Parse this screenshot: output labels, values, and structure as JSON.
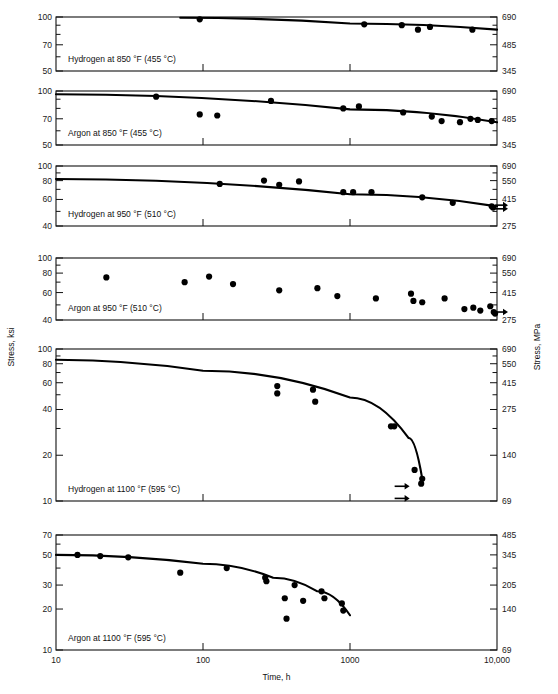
{
  "figure": {
    "y_axis_left_title": "Stress, ksi",
    "y_axis_right_title": "Stress, MPa",
    "x_axis_title": "Time, h",
    "x_ticks": [
      "10",
      "100",
      "1000",
      "10,000"
    ]
  },
  "chart_data": [
    {
      "type": "scatter",
      "title": "Hydrogen at 850 °F (455 °C)",
      "xlabel": "Time, h",
      "ylabel": "Stress, ksi",
      "xscale": "log",
      "yscale": "log",
      "xlim": [
        10,
        10000
      ],
      "ylim": [
        50,
        100
      ],
      "yticks_left": [
        "100",
        "70",
        "50"
      ],
      "yticks_right": [
        "690",
        "485",
        "345"
      ],
      "grid": false,
      "points": [
        {
          "x": 95,
          "y": 97
        },
        {
          "x": 1250,
          "y": 91
        },
        {
          "x": 2250,
          "y": 90
        },
        {
          "x": 2900,
          "y": 85
        },
        {
          "x": 3500,
          "y": 88
        },
        {
          "x": 6800,
          "y": 85
        }
      ],
      "trend": [
        {
          "x": 70,
          "y": 99
        },
        {
          "x": 1000,
          "y": 92
        },
        {
          "x": 10000,
          "y": 85
        }
      ],
      "runouts": []
    },
    {
      "type": "scatter",
      "title": "Argon at 850 °F (455 °C)",
      "xlabel": "Time, h",
      "ylabel": "Stress, ksi",
      "xscale": "log",
      "yscale": "log",
      "xlim": [
        10,
        10000
      ],
      "ylim": [
        50,
        100
      ],
      "yticks_left": [
        "100",
        "70",
        "50"
      ],
      "yticks_right": [
        "690",
        "485",
        "345"
      ],
      "grid": false,
      "points": [
        {
          "x": 48,
          "y": 93
        },
        {
          "x": 95,
          "y": 74
        },
        {
          "x": 125,
          "y": 73
        },
        {
          "x": 290,
          "y": 88
        },
        {
          "x": 900,
          "y": 80
        },
        {
          "x": 1150,
          "y": 82
        },
        {
          "x": 2300,
          "y": 76
        },
        {
          "x": 3600,
          "y": 72
        },
        {
          "x": 4200,
          "y": 68
        },
        {
          "x": 5600,
          "y": 67
        },
        {
          "x": 6600,
          "y": 70
        },
        {
          "x": 7400,
          "y": 69
        },
        {
          "x": 9200,
          "y": 68
        }
      ],
      "trend": [
        {
          "x": 10,
          "y": 96
        },
        {
          "x": 1000,
          "y": 79
        },
        {
          "x": 10000,
          "y": 67
        }
      ],
      "runouts": []
    },
    {
      "type": "scatter",
      "title": "Hydrogen at 950 °F (510 °C)",
      "xlabel": "Time, h",
      "ylabel": "Stress, ksi",
      "xscale": "log",
      "yscale": "log",
      "xlim": [
        10,
        10000
      ],
      "ylim": [
        40,
        100
      ],
      "yticks_left": [
        "100",
        "80",
        "60",
        "40"
      ],
      "yticks_right": [
        "690",
        "550",
        "415",
        "275"
      ],
      "grid": false,
      "points": [
        {
          "x": 130,
          "y": 76
        },
        {
          "x": 260,
          "y": 80
        },
        {
          "x": 330,
          "y": 75
        },
        {
          "x": 450,
          "y": 79
        },
        {
          "x": 900,
          "y": 67
        },
        {
          "x": 1050,
          "y": 67
        },
        {
          "x": 1400,
          "y": 67
        },
        {
          "x": 3100,
          "y": 62
        },
        {
          "x": 5000,
          "y": 57
        },
        {
          "x": 9200,
          "y": 54
        },
        {
          "x": 9400,
          "y": 53
        }
      ],
      "trend": [
        {
          "x": 10,
          "y": 82
        },
        {
          "x": 1000,
          "y": 65
        },
        {
          "x": 10000,
          "y": 54
        }
      ],
      "runouts": [
        {
          "x": 9400,
          "y": 55
        },
        {
          "x": 9400,
          "y": 52
        }
      ]
    },
    {
      "type": "scatter",
      "title": "Argon at 950 °F (510 °C)",
      "xlabel": "Time, h",
      "ylabel": "Stress, ksi",
      "xscale": "log",
      "yscale": "log",
      "xlim": [
        10,
        10000
      ],
      "ylim": [
        40,
        100
      ],
      "yticks_left": [
        "100",
        "80",
        "60",
        "40"
      ],
      "yticks_right": [
        "690",
        "550",
        "415",
        "275"
      ],
      "grid": false,
      "points": [
        {
          "x": 22,
          "y": 75
        },
        {
          "x": 75,
          "y": 70
        },
        {
          "x": 110,
          "y": 76
        },
        {
          "x": 160,
          "y": 68
        },
        {
          "x": 330,
          "y": 62
        },
        {
          "x": 600,
          "y": 64
        },
        {
          "x": 820,
          "y": 57
        },
        {
          "x": 1500,
          "y": 55
        },
        {
          "x": 2600,
          "y": 59
        },
        {
          "x": 2700,
          "y": 53
        },
        {
          "x": 3100,
          "y": 52
        },
        {
          "x": 4400,
          "y": 55
        },
        {
          "x": 6000,
          "y": 47
        },
        {
          "x": 6900,
          "y": 48
        },
        {
          "x": 7700,
          "y": 46
        },
        {
          "x": 9000,
          "y": 49
        },
        {
          "x": 9500,
          "y": 45
        },
        {
          "x": 9700,
          "y": 44
        }
      ],
      "trend": [],
      "runouts": [
        {
          "x": 9700,
          "y": 45
        }
      ]
    },
    {
      "type": "scatter",
      "title": "Hydrogen at 1100 °F (595 °C)",
      "xlabel": "Time, h",
      "ylabel": "Stress, ksi",
      "xscale": "log",
      "yscale": "log",
      "xlim": [
        10,
        10000
      ],
      "ylim": [
        10,
        100
      ],
      "yticks_left": [
        "100",
        "80",
        "60",
        "40",
        "20",
        "10"
      ],
      "yticks_right": [
        "690",
        "550",
        "415",
        "275",
        "140",
        "69"
      ],
      "grid": false,
      "points": [
        {
          "x": 320,
          "y": 57
        },
        {
          "x": 320,
          "y": 51
        },
        {
          "x": 560,
          "y": 54
        },
        {
          "x": 580,
          "y": 45
        },
        {
          "x": 1900,
          "y": 31
        },
        {
          "x": 2000,
          "y": 31
        },
        {
          "x": 2750,
          "y": 16
        },
        {
          "x": 3050,
          "y": 13
        },
        {
          "x": 3100,
          "y": 14
        }
      ],
      "trend": [
        {
          "x": 10,
          "y": 85
        },
        {
          "x": 100,
          "y": 72
        },
        {
          "x": 1000,
          "y": 48
        },
        {
          "x": 2500,
          "y": 26
        },
        {
          "x": 3100,
          "y": 14
        }
      ],
      "runouts": [
        {
          "x": 1950,
          "y": 12.5
        },
        {
          "x": 1950,
          "y": 10.4
        }
      ]
    },
    {
      "type": "scatter",
      "title": "Argon at 1100 °F (595 °C)",
      "xlabel": "Time, h",
      "ylabel": "Stress, ksi",
      "xscale": "log",
      "yscale": "log",
      "xlim": [
        10,
        10000
      ],
      "ylim": [
        10,
        70
      ],
      "yticks_left": [
        "70",
        "50",
        "30",
        "20",
        "10"
      ],
      "yticks_right": [
        "485",
        "345",
        "205",
        "140",
        "69"
      ],
      "grid": false,
      "points": [
        {
          "x": 14,
          "y": 50
        },
        {
          "x": 20,
          "y": 49
        },
        {
          "x": 31,
          "y": 48
        },
        {
          "x": 70,
          "y": 37
        },
        {
          "x": 145,
          "y": 40
        },
        {
          "x": 265,
          "y": 34
        },
        {
          "x": 270,
          "y": 32
        },
        {
          "x": 360,
          "y": 24
        },
        {
          "x": 370,
          "y": 17
        },
        {
          "x": 420,
          "y": 30
        },
        {
          "x": 480,
          "y": 23
        },
        {
          "x": 640,
          "y": 27
        },
        {
          "x": 670,
          "y": 24
        },
        {
          "x": 880,
          "y": 22
        },
        {
          "x": 900,
          "y": 19.5
        }
      ],
      "trend": [
        {
          "x": 10,
          "y": 50
        },
        {
          "x": 100,
          "y": 43
        },
        {
          "x": 300,
          "y": 34
        },
        {
          "x": 600,
          "y": 27
        },
        {
          "x": 1000,
          "y": 18
        }
      ],
      "runouts": []
    }
  ]
}
